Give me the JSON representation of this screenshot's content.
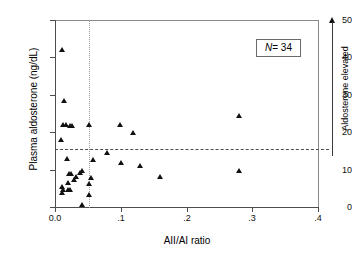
{
  "chart_data": {
    "type": "scatter",
    "title": "",
    "xlabel": "AII/AI ratio",
    "ylabel": "Plasma aldosterone (ng/dL)",
    "xlim": [
      0.0,
      0.4
    ],
    "ylim": [
      0,
      50
    ],
    "xticks": [
      0.0,
      0.1,
      0.2,
      0.3,
      0.4
    ],
    "xtick_labels": [
      "0.0",
      ".1",
      ".2",
      ".3",
      ".4"
    ],
    "yticks": [
      0,
      10,
      20,
      30,
      40,
      50
    ],
    "ytick_labels": [
      "0",
      "10",
      "20",
      "30",
      "40",
      "50"
    ],
    "grid": false,
    "legend": null,
    "marker": "triangle",
    "marker_color": "#111111",
    "points": [
      {
        "x": 0.012,
        "y": 42.0
      },
      {
        "x": 0.015,
        "y": 28.5
      },
      {
        "x": 0.013,
        "y": 22.0
      },
      {
        "x": 0.017,
        "y": 22.0
      },
      {
        "x": 0.023,
        "y": 21.8
      },
      {
        "x": 0.026,
        "y": 21.8
      },
      {
        "x": 0.052,
        "y": 22.1
      },
      {
        "x": 0.01,
        "y": 18.1
      },
      {
        "x": 0.1,
        "y": 22.0
      },
      {
        "x": 0.119,
        "y": 19.9
      },
      {
        "x": 0.281,
        "y": 24.3
      },
      {
        "x": 0.019,
        "y": 12.9
      },
      {
        "x": 0.058,
        "y": 12.6
      },
      {
        "x": 0.08,
        "y": 14.4
      },
      {
        "x": 0.101,
        "y": 11.9
      },
      {
        "x": 0.13,
        "y": 11.0
      },
      {
        "x": 0.161,
        "y": 8.2
      },
      {
        "x": 0.281,
        "y": 9.6
      },
      {
        "x": 0.022,
        "y": 8.9
      },
      {
        "x": 0.025,
        "y": 8.8
      },
      {
        "x": 0.038,
        "y": 9.1
      },
      {
        "x": 0.041,
        "y": 9.6
      },
      {
        "x": 0.033,
        "y": 8.2
      },
      {
        "x": 0.03,
        "y": 7.4
      },
      {
        "x": 0.02,
        "y": 6.5
      },
      {
        "x": 0.055,
        "y": 7.7
      },
      {
        "x": 0.052,
        "y": 6.1
      },
      {
        "x": 0.012,
        "y": 5.4
      },
      {
        "x": 0.013,
        "y": 4.6
      },
      {
        "x": 0.02,
        "y": 4.5
      },
      {
        "x": 0.024,
        "y": 4.7
      },
      {
        "x": 0.011,
        "y": 3.9
      },
      {
        "x": 0.052,
        "y": 3.3
      },
      {
        "x": 0.041,
        "y": 0.7
      }
    ],
    "reference_lines": [
      {
        "orientation": "vertical",
        "value": 0.052,
        "style": "dotted"
      },
      {
        "orientation": "horizontal",
        "value": 15.5,
        "style": "dashed"
      }
    ],
    "annotations": [
      {
        "name": "sample-size",
        "text": "N = 34",
        "position": "top-right-box"
      },
      {
        "name": "aldosterone-elevated",
        "text": "Aldosterone elevated",
        "position": "right-vertical-arrow"
      }
    ]
  },
  "nbox": {
    "symbol": "N",
    "value": "= 34"
  },
  "annotation": {
    "elevated_label": "Aldosterone elevated"
  }
}
